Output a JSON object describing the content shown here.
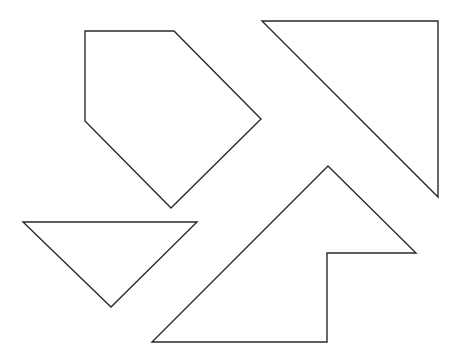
{
  "canvas": {
    "width": 461,
    "height": 358,
    "background": "#ffffff",
    "stroke": "#2a2a2a"
  },
  "shapes": [
    {
      "name": "pentagon",
      "points": "85,31 174,31 261,119 171,208 85,121"
    },
    {
      "name": "right-triangle-top-right",
      "points": "262,21 438,21 438,197"
    },
    {
      "name": "arrow-shape",
      "points": "328,166 416,253 327,253 327,342 152,342"
    },
    {
      "name": "inverted-triangle",
      "points": "23,222 197,222 111,307"
    }
  ]
}
